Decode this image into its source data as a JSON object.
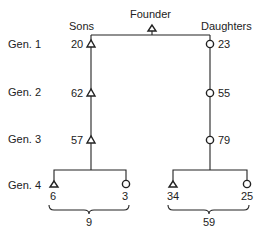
{
  "diagram": {
    "founder_label": "Founder",
    "sons_label": "Sons",
    "daughters_label": "Daughters",
    "generations": [
      {
        "label": "Gen. 1",
        "son_value": "20",
        "daughter_value": "23"
      },
      {
        "label": "Gen. 2",
        "son_value": "62",
        "daughter_value": "55"
      },
      {
        "label": "Gen. 3",
        "son_value": "57",
        "daughter_value": "79"
      },
      {
        "label": "Gen. 4"
      }
    ],
    "gen4": {
      "sons_branch": {
        "male_value": "6",
        "female_value": "3",
        "total": "9"
      },
      "daughters_branch": {
        "male_value": "34",
        "female_value": "25",
        "total": "59"
      }
    },
    "symbols": {
      "male": "triangle",
      "female": "circle"
    }
  }
}
